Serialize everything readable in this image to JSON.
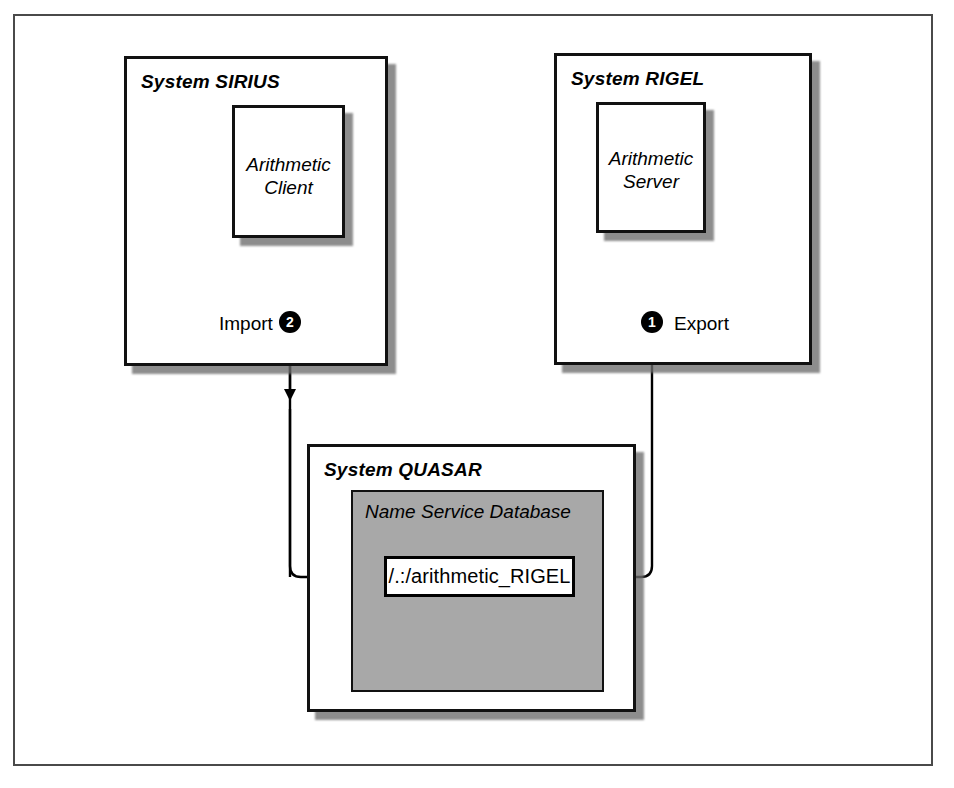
{
  "diagram": {
    "systems": [
      {
        "id": "sirius",
        "label": "System SIRIUS",
        "node": {
          "line1": "Arithmetic",
          "line2": "Client"
        }
      },
      {
        "id": "rigel",
        "label": "System RIGEL",
        "node": {
          "line1": "Arithmetic",
          "line2": "Server"
        }
      },
      {
        "id": "quasar",
        "label": "System QUASAR",
        "database": {
          "label": "Name Service Database",
          "entry": "/.:/arithmetic_RIGEL"
        }
      }
    ],
    "steps": [
      {
        "number": "1",
        "label": "Export"
      },
      {
        "number": "2",
        "label": "Import"
      }
    ],
    "colors": {
      "frame_border": "#4a4a4a",
      "box_border": "#111111",
      "database_fill": "#a8a8a8",
      "shadow": "#6e6e6e",
      "badge_fill": "#000000",
      "badge_text": "#ffffff",
      "page_background": "#ffffff"
    }
  }
}
